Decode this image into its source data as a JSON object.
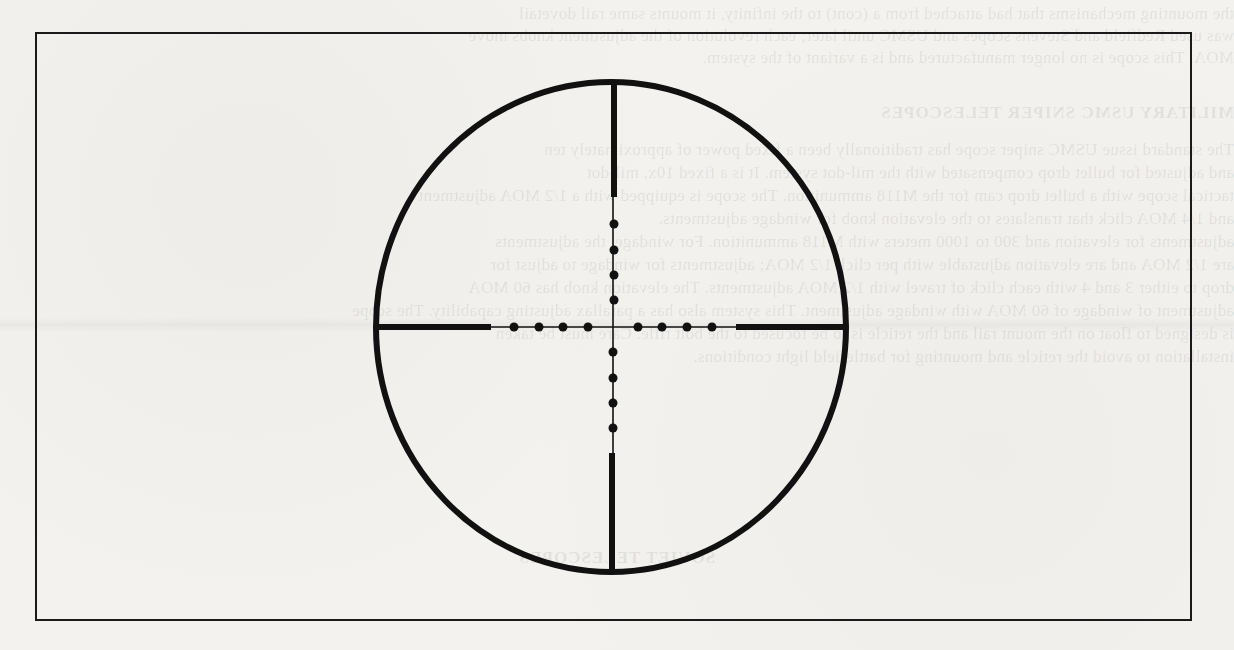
{
  "figure": {
    "type": "rifle-scope-reticle",
    "reticle_style": "mil-dot",
    "frame": {
      "x": 35,
      "y": 32,
      "width": 1157,
      "height": 589,
      "stroke": "#1a1a1a"
    },
    "colors": {
      "ink": "#111111",
      "paper": "#f3f2ef"
    },
    "reticle": {
      "center": {
        "x": 613,
        "y": 327
      },
      "outer_ring": {
        "cx": 611,
        "cy": 327,
        "rx": 235,
        "ry": 245,
        "stroke_width": 6
      },
      "thick_posts": [
        {
          "name": "left-post",
          "x1": 376,
          "y1": 327,
          "x2": 491,
          "y2": 327
        },
        {
          "name": "right-post",
          "x1": 736,
          "y1": 327,
          "x2": 845,
          "y2": 327
        },
        {
          "name": "top-post",
          "x1": 614,
          "y1": 83,
          "x2": 614,
          "y2": 197
        },
        {
          "name": "bottom-post",
          "x1": 612,
          "y1": 453,
          "x2": 612,
          "y2": 572
        }
      ],
      "thin_lines": [
        {
          "name": "horizontal-crosshair",
          "x1": 491,
          "y1": 327,
          "x2": 736,
          "y2": 327
        },
        {
          "name": "vertical-crosshair",
          "x1": 613,
          "y1": 197,
          "x2": 613,
          "y2": 453
        }
      ],
      "dot_radius": 4.5,
      "dots": {
        "left": [
          {
            "x": 514,
            "y": 327
          },
          {
            "x": 539,
            "y": 327
          },
          {
            "x": 563,
            "y": 327
          },
          {
            "x": 588,
            "y": 327
          }
        ],
        "right": [
          {
            "x": 638,
            "y": 327
          },
          {
            "x": 662,
            "y": 327
          },
          {
            "x": 687,
            "y": 327
          },
          {
            "x": 712,
            "y": 327
          }
        ],
        "top": [
          {
            "x": 614,
            "y": 224
          },
          {
            "x": 614,
            "y": 250
          },
          {
            "x": 614,
            "y": 275
          },
          {
            "x": 614,
            "y": 300
          }
        ],
        "bottom": [
          {
            "x": 613,
            "y": 352
          },
          {
            "x": 613,
            "y": 378
          },
          {
            "x": 613,
            "y": 403
          },
          {
            "x": 613,
            "y": 428
          }
        ]
      },
      "dots_per_arm": 4
    }
  },
  "bleed_through": {
    "note": "faint mirrored text from reverse side of scanned page",
    "lines": [
      {
        "y": 4,
        "text": "the mounting mechanisms that had attached from a (cont) to the infinity, it mounts same rail dovetail"
      },
      {
        "y": 26,
        "text": "was used Redfield and Stevens scopes and USMC until later; each revolution of the adjustment knobs move"
      },
      {
        "y": 48,
        "text": "MOA. This scope is no longer manufactured and is a variant of the system."
      },
      {
        "y": 103,
        "text": "MILITARY USMC SNIPER TELESCOPES",
        "heading": true
      },
      {
        "y": 140,
        "text": "The standard issue USMC sniper scope has traditionally been a fixed power of approximately ten"
      },
      {
        "y": 163,
        "text": "and adjusted for bullet drop compensated with the mil-dot system. It is a fixed 10x, mil-dot"
      },
      {
        "y": 186,
        "text": "tactical scope with a bullet drop cam for the M118 ammunition. The scope is equipped with a 1/2 MOA adjustment"
      },
      {
        "y": 209,
        "text": "and 1/4 MOA click that translates to the elevation knob for windage adjustments."
      },
      {
        "y": 232,
        "text": "adjustments for elevation and 300 to 1000 meters with M118 ammunition. For windage, the adjustments"
      },
      {
        "y": 255,
        "text": "are 1/2 MOA and are elevation adjustable with per click 1/2 MOA; adjustments for windage to adjust for"
      },
      {
        "y": 278,
        "text": "drop to either 3 and 4 with each click of travel with 1/2 MOA adjustments. The elevation knob has 60 MOA"
      },
      {
        "y": 301,
        "text": "adjustment of windage of 60 MOA with windage adjustment. This system also has a parallax adjusting capability. The scope"
      },
      {
        "y": 324,
        "text": "is designed to float on the mount rail and the reticle is to be focused to the bolt rifle. Care must be taken"
      },
      {
        "y": 347,
        "text": "installation to avoid the reticle and mounting for battlefield light conditions."
      },
      {
        "y": 548,
        "text": "SOVIET TELESCOPES",
        "heading": true,
        "center": true
      }
    ]
  }
}
